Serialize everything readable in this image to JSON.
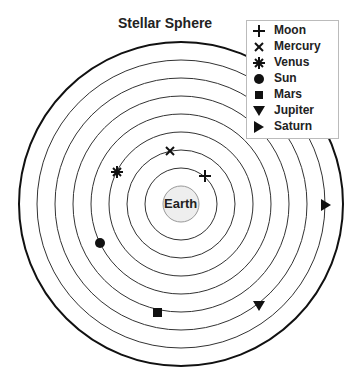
{
  "title": "Stellar Sphere",
  "center_label": "Earth",
  "legend": [
    {
      "label": "Moon",
      "icon": "plus-icon"
    },
    {
      "label": "Mercury",
      "icon": "cross-icon"
    },
    {
      "label": "Venus",
      "icon": "asterisk-icon"
    },
    {
      "label": "Sun",
      "icon": "circle-icon"
    },
    {
      "label": "Mars",
      "icon": "square-icon"
    },
    {
      "label": "Jupiter",
      "icon": "triangle-down-icon"
    },
    {
      "label": "Saturn",
      "icon": "triangle-right-icon"
    }
  ],
  "colors": {
    "line": "#222222",
    "earth_fill": "#eeeeee",
    "earth_stroke": "#999999"
  }
}
